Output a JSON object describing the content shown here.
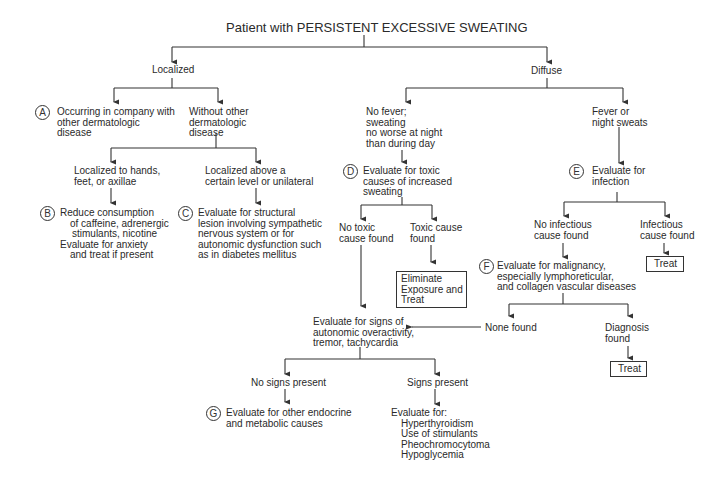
{
  "title": "Patient with PERSISTENT EXCESSIVE SWEATING",
  "nodes": {
    "localized": "Localized",
    "diffuse": "Diffuse",
    "a_label": "A",
    "a_text": "Occurring in company with\nother dermatologic\ndisease",
    "without_other": "Without other\ndermatologic\ndisease",
    "hands_feet": "Localized to hands,\nfeet, or axillae",
    "above_level": "Localized above a\ncertain level or unilateral",
    "b_label": "B",
    "b_line1": "Reduce consumption",
    "b_line2": "of caffeine, adrenergic",
    "b_line3": "stimulants, nicotine",
    "b_line4": "Evaluate for anxiety",
    "b_line5": "and treat if present",
    "c_label": "C",
    "c_text": "Evaluate for structural\nlesion involving sympathetic\nnervous system or for\nautonomic dysfunction such\nas in diabetes mellitus",
    "no_fever": "No fever;\nsweating\nno worse at night\nthan during day",
    "fever": "Fever or\nnight sweats",
    "d_label": "D",
    "d_text": "Evaluate for toxic\ncauses of increased\nsweating",
    "e_label": "E",
    "e_text": "Evaluate for\ninfection",
    "no_toxic": "No toxic\ncause found",
    "toxic_found": "Toxic cause\nfound",
    "eliminate": "Eliminate\nExposure and\nTreat",
    "no_infectious": "No infectious\ncause found",
    "infectious_found": "Infectious\ncause found",
    "treat_1": "Treat",
    "f_label": "F",
    "f_text": "Evaluate for malignancy,\nespecially lymphoreticular,\nand collagen vascular diseases",
    "autonomic": "Evaluate for signs of\nautonomic overactivity,\ntremor, tachycardia",
    "none_found": "None found",
    "diagnosis_found": "Diagnosis\nfound",
    "treat_2": "Treat",
    "no_signs": "No signs present",
    "signs_present": "Signs present",
    "g_label": "G",
    "g_text": "Evaluate for other endocrine\nand metabolic causes",
    "evaluate_for": "Evaluate for:",
    "eval_items": [
      "Hyperthyroidism",
      "Use of stimulants",
      "Pheochromocytoma",
      "Hypoglycemia"
    ]
  }
}
